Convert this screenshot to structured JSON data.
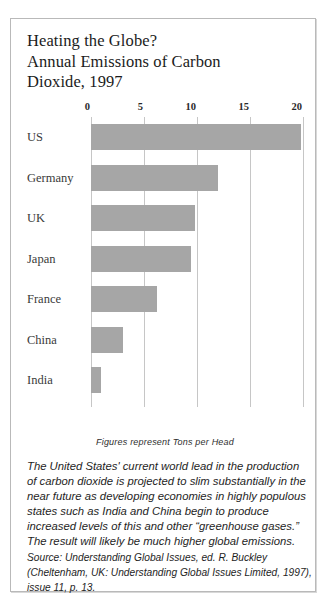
{
  "figure": {
    "title_lines": [
      "Heating the Globe?",
      "Annual Emissions of Carbon",
      "Dioxide, 1997"
    ],
    "caption": "Figures represent Tons per Head",
    "body_lines": [
      "The United States' current world lead in the production",
      "of carbon dioxide is projected to slim substantially in the",
      "near future as developing economies in highly populous",
      "states such as India and China begin to produce",
      "increased levels of this and other “greenhouse gases.”",
      "The result will likely be much higher global emissions."
    ],
    "source_lines": [
      "Source: Understanding Global Issues, ed. R. Buckley",
      "(Cheltenham, UK: Understanding Global Issues Limited, 1997),",
      "issue 11, p. 13."
    ]
  },
  "colors": {
    "bar_fill": "#a6a6a6",
    "gridline": "#c6c6c6",
    "border": "#b9b9b9",
    "title_text": "#1b1b1b",
    "label_text": "#3a3a3a"
  },
  "chart_data": {
    "type": "bar",
    "orientation": "horizontal",
    "title": "Heating the Globe? Annual Emissions of Carbon Dioxide, 1997",
    "subtitle": "Figures represent Tons per Head",
    "xlabel": "",
    "ylabel": "",
    "categories": [
      "US",
      "Germany",
      "UK",
      "Japan",
      "France",
      "China",
      "India"
    ],
    "values": [
      19.8,
      12.0,
      9.8,
      9.4,
      6.2,
      3.0,
      0.9
    ],
    "units": "Tons per Head",
    "xlim": [
      0,
      20
    ],
    "xticks": [
      0,
      5,
      10,
      15,
      20
    ],
    "xtick_labels": [
      "0",
      "5",
      "10",
      "15",
      "20"
    ],
    "axis_position": "top",
    "grid": true,
    "grid_axis": "x",
    "legend": false,
    "series": [
      {
        "name": "Annual CO2 emissions per head, 1997",
        "values": [
          19.8,
          12.0,
          9.8,
          9.4,
          6.2,
          3.0,
          0.9
        ]
      }
    ]
  }
}
